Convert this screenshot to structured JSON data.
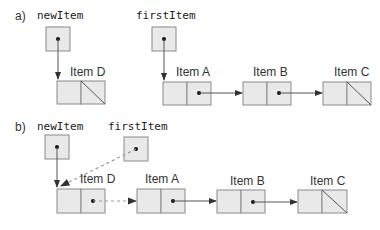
{
  "diagram": {
    "part_a": {
      "label": "a)",
      "pointers": [
        {
          "name": "newItem"
        },
        {
          "name": "firstItem"
        }
      ],
      "nodes": [
        {
          "label": "Item D",
          "next": "null"
        },
        {
          "label": "Item A",
          "next": "Item B"
        },
        {
          "label": "Item B",
          "next": "Item C"
        },
        {
          "label": "Item C",
          "next": "null"
        }
      ]
    },
    "part_b": {
      "label": "b)",
      "pointers": [
        {
          "name": "newItem"
        },
        {
          "name": "firstItem"
        }
      ],
      "nodes": [
        {
          "label": "Item D",
          "next": "Item A"
        },
        {
          "label": "Item A",
          "next": "Item B"
        },
        {
          "label": "Item B",
          "next": "Item C"
        },
        {
          "label": "Item C",
          "next": "null"
        }
      ]
    },
    "colors": {
      "node_fill": "#e9e9e9",
      "node_border": "#8a8a8a",
      "new_link": "#999999"
    }
  }
}
